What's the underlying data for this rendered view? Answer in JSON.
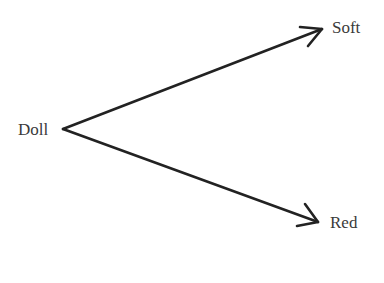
{
  "diagram": {
    "type": "branching-association",
    "source": {
      "label": "Doll"
    },
    "targets": [
      {
        "label": "Soft",
        "position": "top-right"
      },
      {
        "label": "Red",
        "position": "bottom-right"
      }
    ],
    "edges": [
      {
        "from": "Doll",
        "to": "Soft",
        "style": "arrow"
      },
      {
        "from": "Doll",
        "to": "Red",
        "style": "arrow"
      }
    ],
    "colors": {
      "line": "#222222",
      "text": "#3a3a3a",
      "background": "#ffffff"
    }
  }
}
